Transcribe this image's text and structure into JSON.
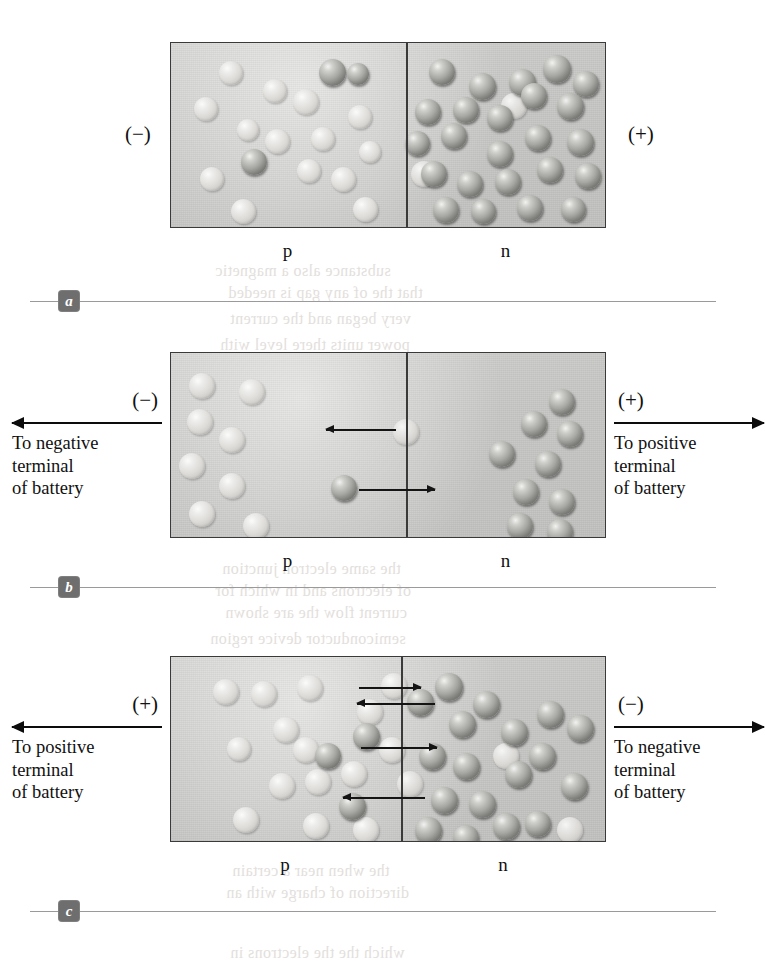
{
  "figure": {
    "colors": {
      "device_fill": "#c9c9c7",
      "border": "#3a3a3a",
      "electron": "#7c7c78",
      "hole": "#dedcd9",
      "arrow": "#141414",
      "badge": "#6e6e6e",
      "rule": "#9a9a9a"
    }
  },
  "panels": [
    {
      "id": "a",
      "badge": "a",
      "left_polarity": "(−)",
      "right_polarity": "(+)",
      "left_region_label": "p",
      "right_region_label": "n",
      "left_terminal": null,
      "right_terminal": null,
      "box": {
        "x": 170,
        "y": 42,
        "w": 436,
        "h": 186,
        "junction_x": 405
      },
      "holes": [
        [
          218,
          60,
          24
        ],
        [
          262,
          78,
          24
        ],
        [
          193,
          96,
          24
        ],
        [
          292,
          88,
          26
        ],
        [
          310,
          126,
          24
        ],
        [
          236,
          118,
          22
        ],
        [
          347,
          104,
          24
        ],
        [
          264,
          128,
          25
        ],
        [
          296,
          158,
          24
        ],
        [
          330,
          166,
          25
        ],
        [
          199,
          166,
          24
        ],
        [
          230,
          198,
          25
        ],
        [
          352,
          196,
          25
        ],
        [
          358,
          140,
          22
        ]
      ],
      "electrons": [
        [
          318,
          58,
          27
        ],
        [
          240,
          148,
          26
        ],
        [
          346,
          62,
          22
        ],
        [
          428,
          58,
          26
        ],
        [
          468,
          72,
          27
        ],
        [
          508,
          68,
          27
        ],
        [
          542,
          54,
          28
        ],
        [
          572,
          70,
          26
        ],
        [
          414,
          98,
          26
        ],
        [
          452,
          96,
          26
        ],
        [
          486,
          104,
          26
        ],
        [
          520,
          82,
          26
        ],
        [
          556,
          92,
          27
        ],
        [
          404,
          130,
          25
        ],
        [
          440,
          122,
          26
        ],
        [
          486,
          140,
          26
        ],
        [
          524,
          124,
          26
        ],
        [
          566,
          128,
          27
        ],
        [
          420,
          160,
          26
        ],
        [
          456,
          170,
          26
        ],
        [
          494,
          168,
          26
        ],
        [
          536,
          156,
          26
        ],
        [
          574,
          162,
          26
        ],
        [
          432,
          196,
          26
        ],
        [
          470,
          198,
          25
        ],
        [
          516,
          194,
          26
        ],
        [
          560,
          196,
          25
        ]
      ],
      "pale_electrons": [
        [
          500,
          92,
          26
        ],
        [
          410,
          160,
          26
        ]
      ],
      "flow_arrows": []
    },
    {
      "id": "b",
      "badge": "b",
      "left_polarity": "(−)",
      "right_polarity": "(+)",
      "left_region_label": "p",
      "right_region_label": "n",
      "left_terminal": {
        "sign": "(−)",
        "caption": "To negative\nterminal\nof battery",
        "direction": "left"
      },
      "right_terminal": {
        "sign": "(+)",
        "caption": "To positive\nterminal\nof battery",
        "direction": "right"
      },
      "box": {
        "x": 170,
        "y": 352,
        "w": 436,
        "h": 186,
        "junction_x": 405
      },
      "holes": [
        [
          188,
          372,
          26
        ],
        [
          238,
          378,
          26
        ],
        [
          186,
          408,
          26
        ],
        [
          218,
          426,
          26
        ],
        [
          178,
          452,
          26
        ],
        [
          218,
          472,
          26
        ],
        [
          188,
          500,
          26
        ],
        [
          242,
          512,
          26
        ]
      ],
      "electrons": [
        [
          330,
          474,
          26
        ],
        [
          548,
          388,
          26
        ],
        [
          520,
          410,
          26
        ],
        [
          556,
          420,
          26
        ],
        [
          488,
          440,
          26
        ],
        [
          534,
          450,
          26
        ],
        [
          512,
          478,
          26
        ],
        [
          548,
          488,
          26
        ],
        [
          506,
          512,
          26
        ],
        [
          546,
          518,
          26
        ]
      ],
      "pale_electrons": [
        [
          392,
          418,
          26
        ]
      ],
      "flow_arrows": [
        {
          "direction": "left",
          "x": 325,
          "y": 428,
          "w": 70
        },
        {
          "direction": "right",
          "x": 358,
          "y": 488,
          "w": 76
        }
      ]
    },
    {
      "id": "c",
      "badge": "c",
      "left_polarity": "(+)",
      "right_polarity": "(−)",
      "left_region_label": "p",
      "right_region_label": "n",
      "left_terminal": {
        "sign": "(+)",
        "caption": "To positive\nterminal\nof battery",
        "direction": "left"
      },
      "right_terminal": {
        "sign": "(−)",
        "caption": "To negative\nterminal\nof battery",
        "direction": "right"
      },
      "box": {
        "x": 170,
        "y": 656,
        "w": 436,
        "h": 186,
        "junction_x": 400
      },
      "holes": [
        [
          212,
          678,
          26
        ],
        [
          250,
          680,
          26
        ],
        [
          296,
          674,
          26
        ],
        [
          272,
          716,
          26
        ],
        [
          226,
          736,
          24
        ],
        [
          292,
          736,
          26
        ],
        [
          268,
          772,
          26
        ],
        [
          304,
          768,
          26
        ],
        [
          232,
          806,
          26
        ],
        [
          302,
          812,
          26
        ],
        [
          356,
          698,
          26
        ],
        [
          340,
          760,
          26
        ],
        [
          352,
          816,
          26
        ],
        [
          380,
          672,
          26
        ],
        [
          378,
          736,
          26
        ]
      ],
      "electrons": [
        [
          352,
          722,
          27
        ],
        [
          314,
          742,
          26
        ],
        [
          338,
          792,
          27
        ],
        [
          406,
          688,
          27
        ],
        [
          434,
          672,
          28
        ],
        [
          418,
          742,
          27
        ],
        [
          448,
          710,
          27
        ],
        [
          472,
          690,
          27
        ],
        [
          452,
          752,
          27
        ],
        [
          430,
          786,
          27
        ],
        [
          468,
          790,
          27
        ],
        [
          500,
          718,
          27
        ],
        [
          504,
          760,
          27
        ],
        [
          492,
          812,
          27
        ],
        [
          536,
          700,
          27
        ],
        [
          528,
          742,
          27
        ],
        [
          560,
          772,
          27
        ],
        [
          566,
          714,
          27
        ],
        [
          414,
          816,
          27
        ],
        [
          452,
          824,
          26
        ],
        [
          524,
          810,
          26
        ]
      ],
      "pale_electrons": [
        [
          492,
          742,
          26
        ],
        [
          396,
          770,
          26
        ],
        [
          556,
          816,
          26
        ]
      ],
      "flow_arrows": [
        {
          "direction": "right",
          "x": 358,
          "y": 686,
          "w": 62
        },
        {
          "direction": "left",
          "x": 356,
          "y": 702,
          "w": 78
        },
        {
          "direction": "right",
          "x": 360,
          "y": 746,
          "w": 76
        },
        {
          "direction": "left",
          "x": 342,
          "y": 796,
          "w": 82
        }
      ]
    }
  ],
  "marks": [
    {
      "id": "a",
      "label": "a",
      "y": 290,
      "x": 30,
      "w": 686
    },
    {
      "id": "b",
      "label": "b",
      "y": 576,
      "x": 30,
      "w": 686
    },
    {
      "id": "c",
      "label": "c",
      "y": 900,
      "x": 30,
      "w": 686
    }
  ],
  "ghost_text": [
    {
      "text": "substance also a magnetic",
      "x": 215,
      "y": 262,
      "size": 16
    },
    {
      "text": "that the of any gap is needed",
      "x": 228,
      "y": 284,
      "size": 16
    },
    {
      "text": "very began and the current",
      "x": 230,
      "y": 310,
      "size": 16
    },
    {
      "text": "power units there level with",
      "x": 220,
      "y": 336,
      "size": 16
    },
    {
      "text": "the same electron junction",
      "x": 222,
      "y": 560,
      "size": 16
    },
    {
      "text": "of electrons and in which for",
      "x": 215,
      "y": 582,
      "size": 16
    },
    {
      "text": "current flow the are shown",
      "x": 225,
      "y": 604,
      "size": 16
    },
    {
      "text": "semiconductor device region",
      "x": 210,
      "y": 630,
      "size": 16
    },
    {
      "text": "the when near a certain",
      "x": 232,
      "y": 862,
      "size": 16
    },
    {
      "text": "direction of charge with an",
      "x": 226,
      "y": 884,
      "size": 16
    },
    {
      "text": "which the the electrons in",
      "x": 230,
      "y": 944,
      "size": 16
    }
  ]
}
